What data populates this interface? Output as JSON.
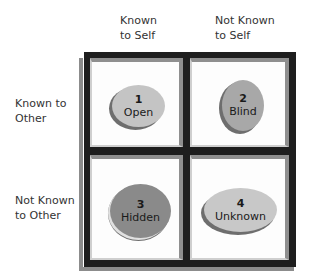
{
  "columns": [
    {
      "line1": "Known",
      "line2": "to Self"
    },
    {
      "line1": "Not Known",
      "line2": "to Self"
    }
  ],
  "rows": [
    {
      "line1": "Known to",
      "line2": "Other"
    },
    {
      "line1": "Not Known",
      "line2": "to Other"
    }
  ],
  "quadrants": [
    {
      "number": "1",
      "name": "Open",
      "color": "#c4c4c4"
    },
    {
      "number": "2",
      "name": "Blind",
      "color": "#a8a8a8"
    },
    {
      "number": "3",
      "name": "Hidden",
      "color": "#8a8a8a"
    },
    {
      "number": "4",
      "name": "Unknown",
      "color": "#c8c8c8"
    }
  ]
}
